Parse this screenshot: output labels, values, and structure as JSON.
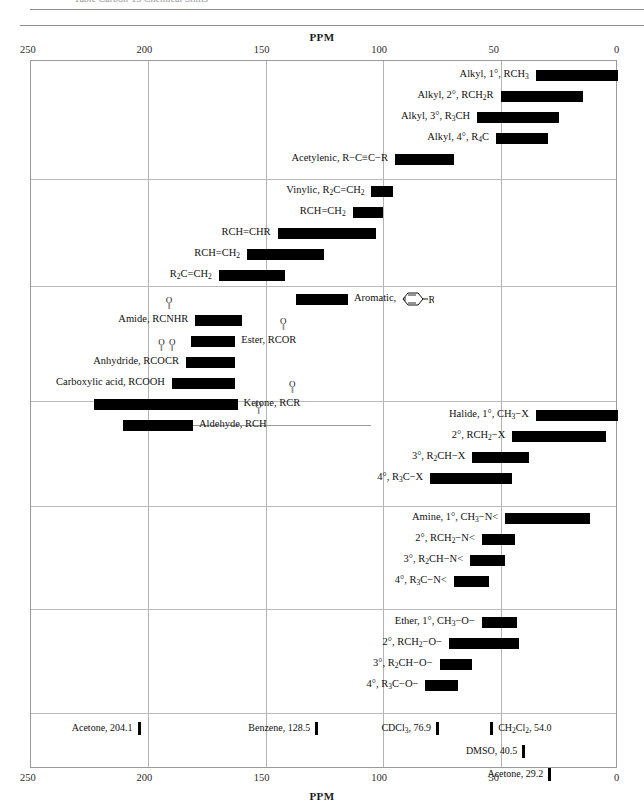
{
  "page": {
    "clipped_header": "Table  Carbon-13 Chemical Shifts",
    "axis_title_top": "PPM",
    "axis_title_bottom": "PPM"
  },
  "axis": {
    "min_ppm": 0,
    "max_ppm": 250,
    "direction": "reversed",
    "ticks": [
      250,
      200,
      150,
      100,
      50,
      0
    ],
    "tick_labels": [
      "250",
      "200",
      "150",
      "100",
      "50",
      "0"
    ],
    "gridlines": [
      200,
      150,
      100,
      50
    ]
  },
  "chart_data": {
    "type": "bar",
    "orientation": "horizontal-range",
    "title": "Carbon-13 Chemical Shifts",
    "xlabel": "PPM",
    "ylabel": "",
    "xlim": [
      250,
      0
    ],
    "grid": true,
    "legend": "none",
    "sections": [
      {
        "name": "alkyl-and-alkyne",
        "rows": [
          {
            "label": "Alkyl, 1°, RCH₃",
            "label_html": "Alkyl, 1°, RCH<sub>3</sub>",
            "start_ppm": 35,
            "end_ppm": 0,
            "label_side": "left"
          },
          {
            "label": "Alkyl, 2°, RCH₂R",
            "label_html": "Alkyl, 2°, RCH<sub>2</sub>R",
            "start_ppm": 50,
            "end_ppm": 15,
            "label_side": "left"
          },
          {
            "label": "Alkyl, 3°, R₃CH",
            "label_html": "Alkyl, 3°, R<sub>3</sub>CH",
            "start_ppm": 60,
            "end_ppm": 25,
            "label_side": "left"
          },
          {
            "label": "Alkyl, 4°, R₄C",
            "label_html": "Alkyl, 4°, R<sub>4</sub>C",
            "start_ppm": 52,
            "end_ppm": 30,
            "label_side": "left"
          },
          {
            "label": "Acetylenic, R−C≡C−R",
            "label_html": "Acetylenic, R&#8722;C&#8801;C&#8722;R",
            "start_ppm": 95,
            "end_ppm": 70,
            "label_side": "left"
          }
        ]
      },
      {
        "name": "alkene",
        "rows": [
          {
            "label": "Vinylic, R₂C=CH₂",
            "label_html": "Vinylic, R<sub>2</sub>C=CH<sub>2</sub>",
            "start_ppm": 105,
            "end_ppm": 96,
            "label_side": "left"
          },
          {
            "label": "RCH=CH₂",
            "label_html": "RCH=CH<sub>2</sub>",
            "start_ppm": 113,
            "end_ppm": 100,
            "label_side": "left"
          },
          {
            "label": "RCH=CHR",
            "label_html": "RCH=CHR",
            "start_ppm": 145,
            "end_ppm": 103,
            "label_side": "left"
          },
          {
            "label": "RCH=CH₂",
            "label_html": "RCH=CH<sub>2</sub>",
            "start_ppm": 158,
            "end_ppm": 125,
            "label_side": "left"
          },
          {
            "label": "R₂C=CH₂",
            "label_html": "R<sub>2</sub>C=CH<sub>2</sub>",
            "start_ppm": 170,
            "end_ppm": 142,
            "label_side": "left"
          }
        ]
      },
      {
        "name": "aromatic-and-carbonyl",
        "rows": [
          {
            "label": "Aromatic,",
            "label_html": "Aromatic,",
            "start_ppm": 137,
            "end_ppm": 115,
            "label_side": "right",
            "icon": "benzene-ring-R"
          },
          {
            "label": "Amide, RCNHR",
            "label_html": "Amide, RCNHR",
            "start_ppm": 180,
            "end_ppm": 160,
            "label_side": "left",
            "carbonyl_over": "C"
          },
          {
            "label": "Ester, RCOR",
            "label_html": "Ester, RCOR",
            "start_ppm": 182,
            "end_ppm": 163,
            "label_side": "right",
            "carbonyl_over": "C"
          },
          {
            "label": "Anhydride, RCOCR",
            "label_html": "Anhydride, RCOCR",
            "start_ppm": 184,
            "end_ppm": 163,
            "label_side": "left",
            "carbonyl_over": "CC"
          },
          {
            "label": "Carboxylic acid, RCOOH",
            "label_html": "Carboxylic acid, RCOOH",
            "start_ppm": 190,
            "end_ppm": 163,
            "label_side": "left"
          },
          {
            "label": "Ketone, RCR",
            "label_html": "Ketone, RCR",
            "start_ppm": 223,
            "end_ppm": 162,
            "label_side": "right",
            "carbonyl_over": "C"
          },
          {
            "label": "Aldehyde, RCH",
            "label_html": "Aldehyde, RCH",
            "start_ppm": 211,
            "end_ppm": 181,
            "label_side": "right",
            "carbonyl_over": "C",
            "leader": true
          }
        ]
      },
      {
        "name": "halide",
        "rows": [
          {
            "label": "Halide, 1°, CH₃−X",
            "label_html": "Halide, 1°, CH<sub>3</sub>&#8722;X",
            "start_ppm": 35,
            "end_ppm": 0,
            "label_side": "left"
          },
          {
            "label": "2°, RCH₂−X",
            "label_html": "2°, RCH<sub>2</sub>&#8722;X",
            "start_ppm": 45,
            "end_ppm": 5,
            "label_side": "left"
          },
          {
            "label": "3°, R₂CH−X",
            "label_html": "3°, R<sub>2</sub>CH&#8722;X",
            "start_ppm": 62,
            "end_ppm": 38,
            "label_side": "left"
          },
          {
            "label": "4°, R₃C−X",
            "label_html": "4°, R<sub>3</sub>C&#8722;X",
            "start_ppm": 80,
            "end_ppm": 45,
            "label_side": "left"
          }
        ]
      },
      {
        "name": "amine",
        "rows": [
          {
            "label": "Amine, 1°, CH₃−N<",
            "label_html": "Amine, 1°, CH<sub>3</sub>&#8722;N&lt;",
            "start_ppm": 48,
            "end_ppm": 12,
            "label_side": "left"
          },
          {
            "label": "2°, RCH₂−N<",
            "label_html": "2°, RCH<sub>2</sub>&#8722;N&lt;",
            "start_ppm": 58,
            "end_ppm": 44,
            "label_side": "left"
          },
          {
            "label": "3°, R₂CH−N<",
            "label_html": "3°, R<sub>2</sub>CH&#8722;N&lt;",
            "start_ppm": 63,
            "end_ppm": 48,
            "label_side": "left"
          },
          {
            "label": "4°, R₃C−N<",
            "label_html": "4°, R<sub>3</sub>C&#8722;N&lt;",
            "start_ppm": 70,
            "end_ppm": 55,
            "label_side": "left"
          }
        ]
      },
      {
        "name": "ether-alcohol",
        "rows": [
          {
            "label": "Ether, 1°, CH₃−O−",
            "label_html": "Ether, 1°, CH<sub>3</sub>&#8722;O&#8722;",
            "start_ppm": 58,
            "end_ppm": 43,
            "label_side": "left"
          },
          {
            "label": "2°, RCH₂−O−",
            "label_html": "2°, RCH<sub>2</sub>&#8722;O&#8722;",
            "start_ppm": 72,
            "end_ppm": 42,
            "label_side": "left"
          },
          {
            "label": "3°, R₂CH−O−",
            "label_html": "3°, R<sub>2</sub>CH&#8722;O&#8722;",
            "start_ppm": 76,
            "end_ppm": 62,
            "label_side": "left"
          },
          {
            "label": "4°, R₃C−O−",
            "label_html": "4°, R<sub>3</sub>C&#8722;O&#8722;",
            "start_ppm": 82,
            "end_ppm": 68,
            "label_side": "left"
          }
        ]
      }
    ],
    "solvent_references": [
      {
        "label": "Acetone, 204.1",
        "label_html": "Acetone, 204.1",
        "ppm": 204.1,
        "label_side": "left",
        "row": 0
      },
      {
        "label": "Benzene, 128.5",
        "label_html": "Benzene, 128.5",
        "ppm": 128.5,
        "label_side": "left",
        "row": 0
      },
      {
        "label": "CDCl₃, 76.9",
        "label_html": "CDCl<sub>3</sub>, 76.9",
        "ppm": 76.9,
        "label_side": "left",
        "row": 0
      },
      {
        "label": "CH₂Cl₂, 54.0",
        "label_html": "CH<sub>2</sub>Cl<sub>2</sub>, 54.0",
        "ppm": 54.0,
        "label_side": "right",
        "row": 0
      },
      {
        "label": "DMSO, 40.5",
        "label_html": "DMSO, 40.5",
        "ppm": 40.5,
        "label_side": "left",
        "row": 1
      },
      {
        "label": "Acetone, 29.2",
        "label_html": "Acetone, 29.2",
        "ppm": 29.2,
        "label_side": "left",
        "row": 2
      }
    ]
  },
  "colors": {
    "bar": "#000000",
    "grid": "#b4b4b4",
    "frame": "#9a9a9a",
    "text": "#111111",
    "background": "#ffffff"
  }
}
